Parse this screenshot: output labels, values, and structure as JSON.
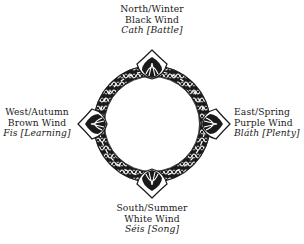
{
  "diagram": {
    "type": "celtic-knot-compass",
    "center": {
      "x": 152,
      "y": 124
    },
    "ring_radius": 53,
    "colors": {
      "ink": "#1a1a1a",
      "background": "#ffffff"
    },
    "directions": {
      "north": {
        "direction_season": "North/Winter",
        "wind": "Black Wind",
        "quality": "Cath [Battle]"
      },
      "east": {
        "direction_season": "East/Spring",
        "wind": "Purple Wind",
        "quality": "Bláth [Plenty]"
      },
      "south": {
        "direction_season": "South/Summer",
        "wind": "White Wind",
        "quality": "Séis [Song]"
      },
      "west": {
        "direction_season": "West/Autumn",
        "wind": "Brown Wind",
        "quality": "Fis [Learning]"
      }
    }
  }
}
